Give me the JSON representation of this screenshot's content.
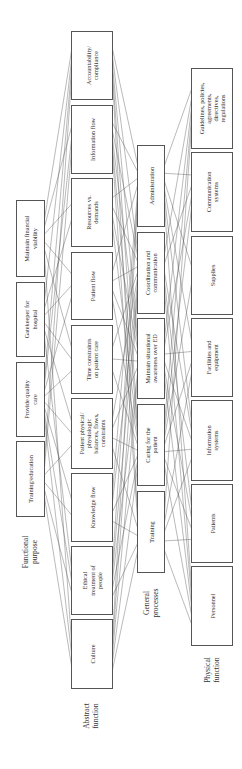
{
  "diagram": {
    "rotation": -90,
    "colors": {
      "box_stroke": "#555555",
      "link": "#4a4a4a",
      "text": "#333333",
      "background": "#ffffff"
    },
    "levels": [
      {
        "id": "functional_purpose",
        "label": [
          "Functional",
          "purpose"
        ],
        "label_pos": {
          "x": 29,
          "y": 552
        },
        "x": 16,
        "width": 28,
        "nodes": [
          {
            "id": "fp1",
            "label": [
              "Maintain financial",
              "viability"
            ],
            "y": 200,
            "h": 76
          },
          {
            "id": "fp2",
            "label": [
              "Gatekeeper for",
              "hospital"
            ],
            "y": 282,
            "h": 74
          },
          {
            "id": "fp3",
            "label": [
              "Provide quality",
              "care"
            ],
            "y": 362,
            "h": 74
          },
          {
            "id": "fp4",
            "label": [
              "Training/education"
            ],
            "y": 441,
            "h": 75
          }
        ]
      },
      {
        "id": "abstract_function",
        "label": [
          "Abstract",
          "function"
        ],
        "label_pos": {
          "x": 90,
          "y": 716
        },
        "x": 71,
        "width": 41,
        "nodes": [
          {
            "id": "af1",
            "label": [
              "Accountability/",
              "compliance"
            ],
            "y": 31,
            "h": 68
          },
          {
            "id": "af2",
            "label": [
              "Information flow"
            ],
            "y": 105,
            "h": 68
          },
          {
            "id": "af3",
            "label": [
              "Resources vs.",
              "demands"
            ],
            "y": 178,
            "h": 68
          },
          {
            "id": "af4",
            "label": [
              "Patient flow"
            ],
            "y": 252,
            "h": 67
          },
          {
            "id": "af5",
            "label": [
              "Time constraints",
              "on patient care"
            ],
            "y": 325,
            "h": 68
          },
          {
            "id": "af6",
            "label": [
              "Patient physical/",
              "physiologic",
              "balances, flows,",
              "constraints"
            ],
            "y": 398,
            "h": 70
          },
          {
            "id": "af7",
            "label": [
              "Knowledge flow"
            ],
            "y": 473,
            "h": 68
          },
          {
            "id": "af8",
            "label": [
              "Ethical",
              "treatment of",
              "people"
            ],
            "y": 546,
            "h": 68
          },
          {
            "id": "af9",
            "label": [
              "Culture"
            ],
            "y": 619,
            "h": 69
          }
        ]
      },
      {
        "id": "general_processes",
        "label": [
          "General",
          "processes"
        ],
        "label_pos": {
          "x": 150,
          "y": 603
        },
        "x": 137,
        "width": 27,
        "nodes": [
          {
            "id": "gp1",
            "label": [
              "Administration"
            ],
            "y": 145,
            "h": 81
          },
          {
            "id": "gp2",
            "label": [
              "Coordination and",
              "communication"
            ],
            "y": 232,
            "h": 81
          },
          {
            "id": "gp3",
            "label": [
              "Maintain situational",
              "awareness over ED"
            ],
            "y": 318,
            "h": 80
          },
          {
            "id": "gp4",
            "label": [
              "Caring for the",
              "patient"
            ],
            "y": 404,
            "h": 81
          },
          {
            "id": "gp5",
            "label": [
              "Training"
            ],
            "y": 491,
            "h": 81
          }
        ]
      },
      {
        "id": "physical_function",
        "label": [
          "Physical",
          "function"
        ],
        "label_pos": {
          "x": 211,
          "y": 670
        },
        "x": 191,
        "width": 41,
        "nodes": [
          {
            "id": "pf1",
            "label": [
              "Guidelines, policies,",
              "agreements,",
              "directives,",
              "regulations"
            ],
            "y": 68,
            "h": 80
          },
          {
            "id": "pf2",
            "label": [
              "Communication",
              "systems"
            ],
            "y": 152,
            "h": 79
          },
          {
            "id": "pf3",
            "label": [
              "Supplies"
            ],
            "y": 236,
            "h": 78
          },
          {
            "id": "pf4",
            "label": [
              "Facilities and",
              "equipment"
            ],
            "y": 318,
            "h": 78
          },
          {
            "id": "pf5",
            "label": [
              "Information",
              "systems"
            ],
            "y": 400,
            "h": 80
          },
          {
            "id": "pf6",
            "label": [
              "Patients"
            ],
            "y": 484,
            "h": 78
          },
          {
            "id": "pf7",
            "label": [
              "Personnel"
            ],
            "y": 566,
            "h": 79
          }
        ]
      }
    ],
    "links_description": "Dense many-to-many connections between every adjacent level (purpose→abstract function→general processes→physical function)",
    "links": [
      [
        "fp1",
        "af1"
      ],
      [
        "fp1",
        "af2"
      ],
      [
        "fp1",
        "af3"
      ],
      [
        "fp1",
        "af4"
      ],
      [
        "fp1",
        "af5"
      ],
      [
        "fp1",
        "af9"
      ],
      [
        "fp2",
        "af1"
      ],
      [
        "fp2",
        "af3"
      ],
      [
        "fp2",
        "af4"
      ],
      [
        "fp2",
        "af5"
      ],
      [
        "fp2",
        "af6"
      ],
      [
        "fp2",
        "af8"
      ],
      [
        "fp3",
        "af1"
      ],
      [
        "fp3",
        "af2"
      ],
      [
        "fp3",
        "af4"
      ],
      [
        "fp3",
        "af5"
      ],
      [
        "fp3",
        "af6"
      ],
      [
        "fp3",
        "af7"
      ],
      [
        "fp3",
        "af8"
      ],
      [
        "fp3",
        "af9"
      ],
      [
        "fp4",
        "af1"
      ],
      [
        "fp4",
        "af2"
      ],
      [
        "fp4",
        "af6"
      ],
      [
        "fp4",
        "af7"
      ],
      [
        "fp4",
        "af8"
      ],
      [
        "fp4",
        "af9"
      ],
      [
        "af1",
        "gp1"
      ],
      [
        "af1",
        "gp2"
      ],
      [
        "af1",
        "gp3"
      ],
      [
        "af1",
        "gp4"
      ],
      [
        "af1",
        "gp5"
      ],
      [
        "af2",
        "gp1"
      ],
      [
        "af2",
        "gp2"
      ],
      [
        "af2",
        "gp3"
      ],
      [
        "af2",
        "gp4"
      ],
      [
        "af2",
        "gp5"
      ],
      [
        "af3",
        "gp1"
      ],
      [
        "af3",
        "gp2"
      ],
      [
        "af3",
        "gp3"
      ],
      [
        "af3",
        "gp4"
      ],
      [
        "af4",
        "gp1"
      ],
      [
        "af4",
        "gp2"
      ],
      [
        "af4",
        "gp3"
      ],
      [
        "af4",
        "gp4"
      ],
      [
        "af5",
        "gp2"
      ],
      [
        "af5",
        "gp3"
      ],
      [
        "af5",
        "gp4"
      ],
      [
        "af6",
        "gp2"
      ],
      [
        "af6",
        "gp3"
      ],
      [
        "af6",
        "gp4"
      ],
      [
        "af6",
        "gp5"
      ],
      [
        "af7",
        "gp1"
      ],
      [
        "af7",
        "gp2"
      ],
      [
        "af7",
        "gp4"
      ],
      [
        "af7",
        "gp5"
      ],
      [
        "af8",
        "gp1"
      ],
      [
        "af8",
        "gp2"
      ],
      [
        "af8",
        "gp3"
      ],
      [
        "af8",
        "gp4"
      ],
      [
        "af8",
        "gp5"
      ],
      [
        "af9",
        "gp1"
      ],
      [
        "af9",
        "gp2"
      ],
      [
        "af9",
        "gp3"
      ],
      [
        "af9",
        "gp4"
      ],
      [
        "af9",
        "gp5"
      ],
      [
        "gp1",
        "pf1"
      ],
      [
        "gp1",
        "pf2"
      ],
      [
        "gp1",
        "pf3"
      ],
      [
        "gp1",
        "pf4"
      ],
      [
        "gp1",
        "pf5"
      ],
      [
        "gp1",
        "pf7"
      ],
      [
        "gp2",
        "pf1"
      ],
      [
        "gp2",
        "pf2"
      ],
      [
        "gp2",
        "pf5"
      ],
      [
        "gp2",
        "pf6"
      ],
      [
        "gp2",
        "pf7"
      ],
      [
        "gp3",
        "pf1"
      ],
      [
        "gp3",
        "pf2"
      ],
      [
        "gp3",
        "pf4"
      ],
      [
        "gp3",
        "pf5"
      ],
      [
        "gp3",
        "pf6"
      ],
      [
        "gp3",
        "pf7"
      ],
      [
        "gp4",
        "pf1"
      ],
      [
        "gp4",
        "pf2"
      ],
      [
        "gp4",
        "pf3"
      ],
      [
        "gp4",
        "pf4"
      ],
      [
        "gp4",
        "pf5"
      ],
      [
        "gp4",
        "pf6"
      ],
      [
        "gp4",
        "pf7"
      ],
      [
        "gp5",
        "pf1"
      ],
      [
        "gp5",
        "pf4"
      ],
      [
        "gp5",
        "pf5"
      ],
      [
        "gp5",
        "pf6"
      ],
      [
        "gp5",
        "pf7"
      ]
    ]
  }
}
